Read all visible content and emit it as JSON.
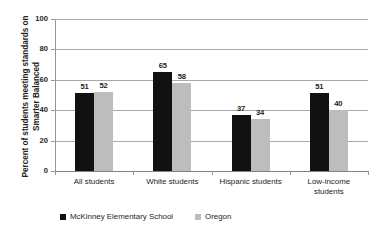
{
  "chart_data": {
    "type": "bar",
    "title": "",
    "xlabel": "",
    "ylabel": "Percent of students meeting standards on Smarter Balanced",
    "ylim": [
      0,
      100
    ],
    "yticks": [
      0,
      20,
      40,
      60,
      80,
      100
    ],
    "ytick_labels": [
      "0",
      "20",
      "40",
      "60",
      "80",
      "100"
    ],
    "grid": true,
    "legend_position": "bottom-left",
    "categories": [
      "All students",
      "White students",
      "Hispanic students",
      "Low-income students"
    ],
    "category_lines": [
      [
        "All students"
      ],
      [
        "White students"
      ],
      [
        "Hispanic students"
      ],
      [
        "Low-income",
        "students"
      ]
    ],
    "series": [
      {
        "name": "McKinney Elementary School",
        "color": "#111111",
        "values": [
          51,
          65,
          37,
          51
        ]
      },
      {
        "name": "Oregon",
        "color": "#bdbdbd",
        "values": [
          52,
          58,
          34,
          40
        ]
      }
    ]
  },
  "legend": {
    "items": [
      {
        "label": "McKinney Elementary School",
        "swatch": "black"
      },
      {
        "label": "Oregon",
        "swatch": "gray"
      }
    ]
  }
}
